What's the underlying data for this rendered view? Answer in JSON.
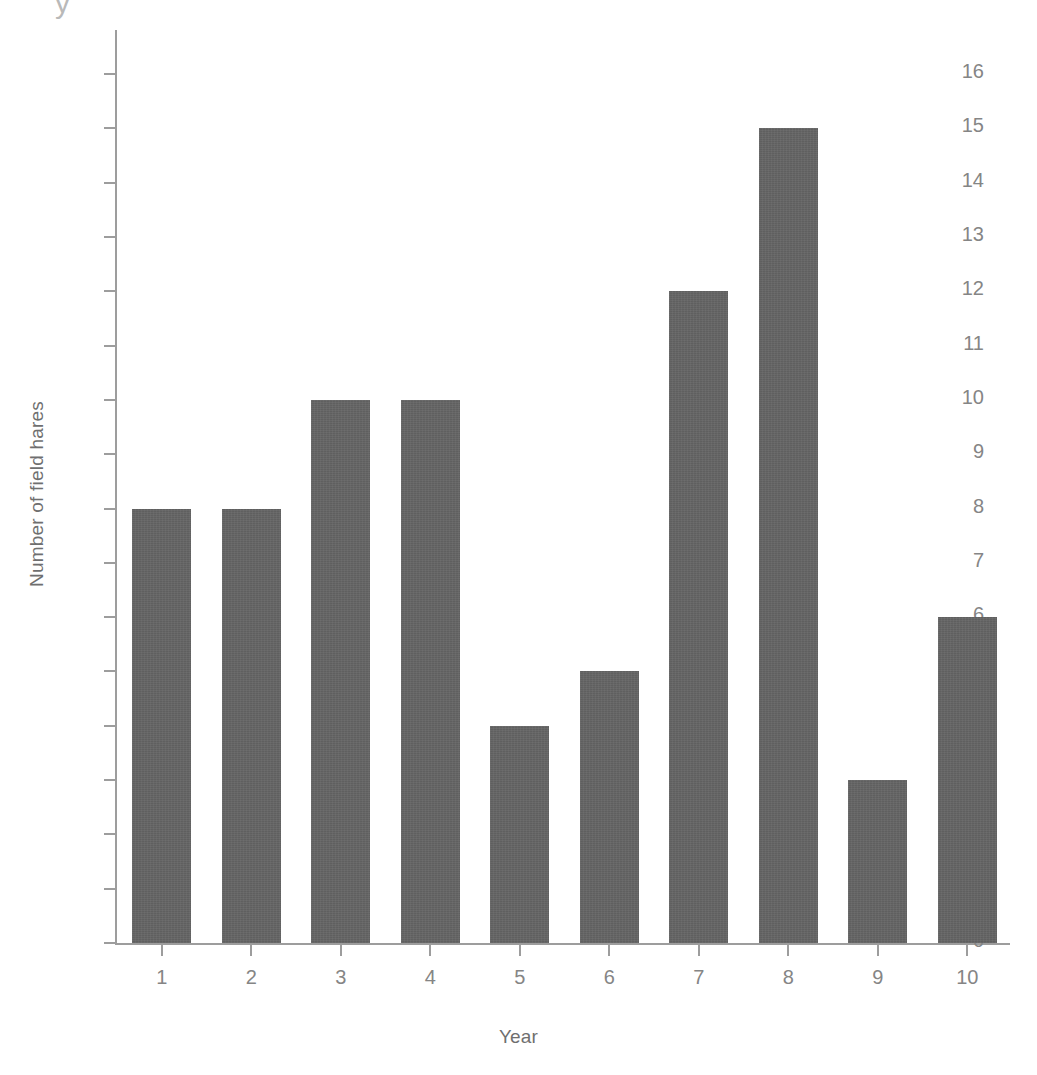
{
  "chart_data": {
    "type": "bar",
    "title": "",
    "xlabel": "Year",
    "ylabel": "Number of field hares",
    "categories": [
      "1",
      "2",
      "3",
      "4",
      "5",
      "6",
      "7",
      "8",
      "9",
      "10"
    ],
    "values": [
      8,
      8,
      10,
      10,
      4,
      5,
      12,
      15,
      3,
      6
    ],
    "ylim": [
      0,
      16
    ],
    "yticks": [
      "0",
      "1",
      "2",
      "3",
      "4",
      "5",
      "6",
      "7",
      "8",
      "9",
      "10",
      "11",
      "12",
      "13",
      "14",
      "15",
      "16"
    ],
    "ytick_values": [
      0,
      1,
      2,
      3,
      4,
      5,
      6,
      7,
      8,
      9,
      10,
      11,
      12,
      13,
      14,
      15,
      16
    ],
    "grid": false,
    "legend": false,
    "legend_position": "none",
    "bar_color": "#636363",
    "axis_color": "#9d9d9d",
    "tick_label_color": "#858585",
    "axis_label_color": "#6f6f6f",
    "background_color": "#ffffff",
    "top_artifact": "y"
  }
}
